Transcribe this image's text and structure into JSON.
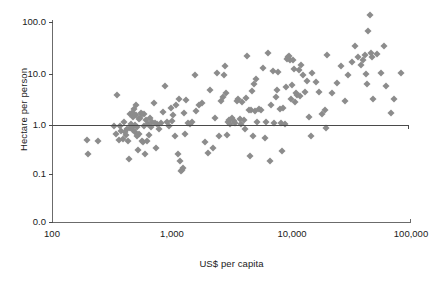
{
  "chart_data": {
    "type": "scatter",
    "title": "",
    "xlabel": "US$ per capita",
    "ylabel": "Hectare per person",
    "xscale": "log",
    "yscale": "log",
    "xlim": [
      100,
      100000
    ],
    "ylim": [
      0.0,
      100.0
    ],
    "grid": false,
    "legend": null,
    "xticks": [
      {
        "value": 100,
        "label": "100",
        "px": 52
      },
      {
        "value": 1000,
        "label": "1,000",
        "px": 172
      },
      {
        "value": 10000,
        "label": "10,000",
        "px": 292
      },
      {
        "value": 100000,
        "label": "100,000",
        "px": 411
      }
    ],
    "yticks": [
      {
        "value": 100.0,
        "label": "100.0",
        "px": 22
      },
      {
        "value": 10.0,
        "label": "10.0",
        "px": 74
      },
      {
        "value": 1.0,
        "label": "1.0",
        "px": 125
      },
      {
        "value": 0.1,
        "label": "0.1",
        "px": 174
      },
      {
        "value": 0.0,
        "label": "0.0",
        "px": 222
      }
    ],
    "annotations": [
      {
        "type": "hline",
        "y": 1.0,
        "label": "reference line at 1.0 hectare per person"
      }
    ],
    "marker": {
      "shape": "diamond",
      "color": "#8c8c8c",
      "size_px": 5
    },
    "points": [
      [
        196,
        0.47
      ],
      [
        200,
        0.25
      ],
      [
        243,
        0.45
      ],
      [
        330,
        0.88
      ],
      [
        345,
        0.62
      ],
      [
        352,
        3.7
      ],
      [
        360,
        0.46
      ],
      [
        368,
        0.9
      ],
      [
        380,
        0.72
      ],
      [
        392,
        0.5
      ],
      [
        400,
        1.05
      ],
      [
        408,
        0.66
      ],
      [
        415,
        0.58
      ],
      [
        424,
        0.78
      ],
      [
        432,
        0.44
      ],
      [
        440,
        0.2
      ],
      [
        448,
        0.8
      ],
      [
        452,
        1.55
      ],
      [
        460,
        0.98
      ],
      [
        465,
        1.6
      ],
      [
        470,
        0.85
      ],
      [
        474,
        1.35
      ],
      [
        478,
        0.74
      ],
      [
        482,
        1.9
      ],
      [
        488,
        1.5
      ],
      [
        492,
        0.68
      ],
      [
        497,
        0.92
      ],
      [
        500,
        2.3
      ],
      [
        505,
        1.45
      ],
      [
        512,
        0.84
      ],
      [
        518,
        0.55
      ],
      [
        524,
        0.3
      ],
      [
        530,
        1.2
      ],
      [
        538,
        0.62
      ],
      [
        545,
        1.25
      ],
      [
        552,
        1.6
      ],
      [
        560,
        0.45
      ],
      [
        568,
        1.5
      ],
      [
        575,
        0.42
      ],
      [
        582,
        1.55
      ],
      [
        590,
        0.9
      ],
      [
        600,
        0.25
      ],
      [
        610,
        1.15
      ],
      [
        622,
        0.44
      ],
      [
        635,
        0.98
      ],
      [
        648,
        0.6
      ],
      [
        660,
        1.3
      ],
      [
        672,
        0.85
      ],
      [
        690,
        1.05
      ],
      [
        710,
        2.5
      ],
      [
        725,
        1.0
      ],
      [
        740,
        0.33
      ],
      [
        760,
        0.95
      ],
      [
        790,
        0.78
      ],
      [
        820,
        1.0
      ],
      [
        850,
        1.7
      ],
      [
        880,
        5.4
      ],
      [
        910,
        1.05
      ],
      [
        950,
        0.9
      ],
      [
        980,
        2.0
      ],
      [
        1000,
        1.1
      ],
      [
        1030,
        1.45
      ],
      [
        1060,
        0.55
      ],
      [
        1090,
        2.3
      ],
      [
        1120,
        0.25
      ],
      [
        1150,
        3.0
      ],
      [
        1180,
        0.18
      ],
      [
        1200,
        0.115
      ],
      [
        1220,
        0.12
      ],
      [
        1240,
        0.13
      ],
      [
        1260,
        1.6
      ],
      [
        1280,
        0.61
      ],
      [
        1320,
        2.9
      ],
      [
        1360,
        1.0
      ],
      [
        1420,
        0.95
      ],
      [
        1480,
        1.05
      ],
      [
        1560,
        9.0
      ],
      [
        1600,
        1.75
      ],
      [
        1700,
        2.3
      ],
      [
        1800,
        2.5
      ],
      [
        1900,
        0.42
      ],
      [
        2000,
        0.26
      ],
      [
        2100,
        4.5
      ],
      [
        2200,
        0.32
      ],
      [
        2300,
        1.25
      ],
      [
        2400,
        10.0
      ],
      [
        2500,
        0.55
      ],
      [
        2600,
        2.8
      ],
      [
        2700,
        3.3
      ],
      [
        2750,
        8.8
      ],
      [
        2800,
        13.5
      ],
      [
        2850,
        3.9
      ],
      [
        2900,
        0.6
      ],
      [
        2950,
        1.05
      ],
      [
        3000,
        1.15
      ],
      [
        3100,
        0.95
      ],
      [
        3200,
        1.25
      ],
      [
        3300,
        1.1
      ],
      [
        3400,
        1.0
      ],
      [
        3500,
        2.7
      ],
      [
        3600,
        3.0
      ],
      [
        3700,
        1.2
      ],
      [
        3800,
        0.95
      ],
      [
        3900,
        2.6
      ],
      [
        4000,
        1.15
      ],
      [
        4100,
        0.78
      ],
      [
        4200,
        3.1
      ],
      [
        4300,
        21.0
      ],
      [
        4400,
        1.85
      ],
      [
        4500,
        0.23
      ],
      [
        4600,
        1.8
      ],
      [
        4700,
        4.4
      ],
      [
        4800,
        0.56
      ],
      [
        4900,
        6.0
      ],
      [
        5000,
        1.75
      ],
      [
        5100,
        7.5
      ],
      [
        5200,
        1.05
      ],
      [
        5400,
        1.9
      ],
      [
        5600,
        1.8
      ],
      [
        5800,
        12.5
      ],
      [
        6000,
        0.52
      ],
      [
        6200,
        1.05
      ],
      [
        6400,
        25.0
      ],
      [
        6600,
        0.18
      ],
      [
        6800,
        2.3
      ],
      [
        7000,
        11.0
      ],
      [
        7200,
        1.0
      ],
      [
        7400,
        3.3
      ],
      [
        7600,
        4.5
      ],
      [
        7800,
        10.5
      ],
      [
        8000,
        1.9
      ],
      [
        8200,
        1.0
      ],
      [
        8400,
        0.28
      ],
      [
        8600,
        2.0
      ],
      [
        8800,
        0.95
      ],
      [
        9000,
        5.2
      ],
      [
        9200,
        19.0
      ],
      [
        9400,
        20.0
      ],
      [
        9600,
        21.5
      ],
      [
        9800,
        18.0
      ],
      [
        10000,
        3.0
      ],
      [
        10200,
        5.6
      ],
      [
        10400,
        17.5
      ],
      [
        10600,
        12.0
      ],
      [
        10800,
        2.6
      ],
      [
        11000,
        4.0
      ],
      [
        11200,
        3.6
      ],
      [
        11500,
        11.5
      ],
      [
        11800,
        3.4
      ],
      [
        12000,
        14.0
      ],
      [
        12500,
        9.0
      ],
      [
        13000,
        4.2
      ],
      [
        13500,
        7.0
      ],
      [
        14000,
        1.35
      ],
      [
        14500,
        0.55
      ],
      [
        15000,
        10.0
      ],
      [
        16000,
        6.5
      ],
      [
        17000,
        4.2
      ],
      [
        18000,
        1.55
      ],
      [
        19000,
        1.8
      ],
      [
        19500,
        0.82
      ],
      [
        20000,
        22.0
      ],
      [
        22000,
        4.0
      ],
      [
        24000,
        6.2
      ],
      [
        26000,
        13.5
      ],
      [
        28000,
        2.8
      ],
      [
        30000,
        9.0
      ],
      [
        32000,
        16.0
      ],
      [
        34000,
        33.0
      ],
      [
        36000,
        20.0
      ],
      [
        38000,
        14.0
      ],
      [
        40000,
        18.0
      ],
      [
        41000,
        22.0
      ],
      [
        42000,
        9.5
      ],
      [
        43000,
        6.0
      ],
      [
        44000,
        65.0
      ],
      [
        45000,
        140.0
      ],
      [
        46000,
        24.0
      ],
      [
        47000,
        20.0
      ],
      [
        48000,
        3.0
      ],
      [
        52000,
        23.0
      ],
      [
        56000,
        10.0
      ],
      [
        60000,
        33.0
      ],
      [
        62000,
        5.5
      ],
      [
        68000,
        1.6
      ],
      [
        72000,
        3.0
      ],
      [
        82000,
        10.0
      ]
    ]
  },
  "axes": {
    "y_title": "Hectare per person",
    "x_title": "US$ per capita"
  }
}
